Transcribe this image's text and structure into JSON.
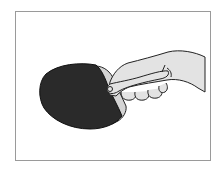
{
  "image": {
    "subject": "hand-holding-table-tennis-paddle",
    "description": "Line illustration of a hand gripping a table tennis paddle (penhold-style grip) with a dark rubber face",
    "colors": {
      "background": "#ffffff",
      "frame_border": "#9a9a9a",
      "paddle_rubber": "#2a2a2a",
      "paddle_edge": "#d4d4d4",
      "skin": "#e3e3e3",
      "outline": "#222222"
    }
  }
}
